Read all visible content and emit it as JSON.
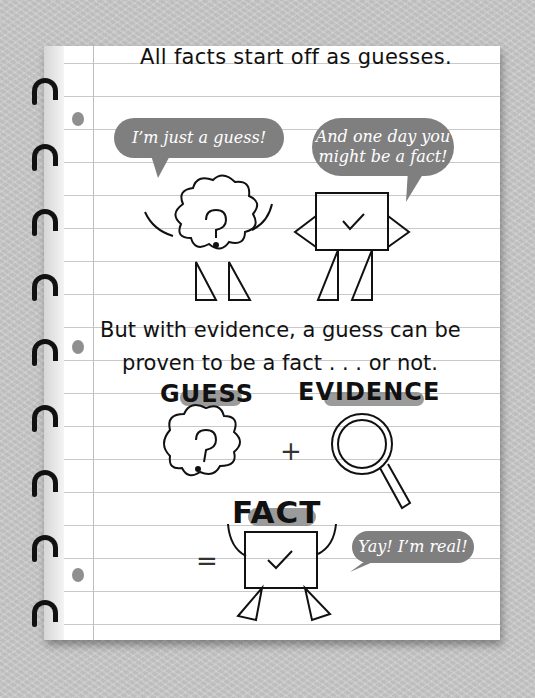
{
  "page": {
    "heading": "All facts start off as guesses.",
    "explanation_line1": "But with evidence, a guess can be",
    "explanation_line2": "proven to be a fact . . . or not."
  },
  "bubbles": {
    "guess_says": "I’m just a guess!",
    "fact_says_line1": "And one day you",
    "fact_says_line2": "might be a fact!",
    "final_says": "Yay! I’m real!"
  },
  "equation": {
    "guess_label": "GUESS",
    "evidence_label": "EVIDENCE",
    "fact_label": "FACT",
    "plus_symbol": "+",
    "equals_symbol": "="
  },
  "icons": {
    "guess": "cloud-question-icon",
    "evidence": "magnifying-glass-icon",
    "fact": "box-checkmark-icon"
  },
  "colors": {
    "bubble": "#7f7f7f",
    "highlight": "#8a8a8a",
    "ink": "#111111",
    "background": "#c9c9c9"
  }
}
